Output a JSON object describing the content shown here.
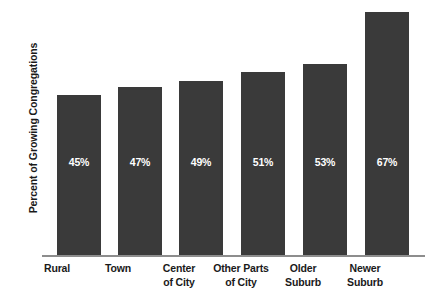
{
  "chart_data": {
    "type": "bar",
    "title": "",
    "xlabel": "",
    "ylabel": "Percent of Growing Congregations",
    "categories": [
      "Rural",
      "Town",
      "Center of City",
      "Other Parts of City",
      "Older Suburb",
      "Newer Suburb"
    ],
    "category_lines": [
      [
        "Rural",
        ""
      ],
      [
        "Town",
        ""
      ],
      [
        "Center",
        "of City"
      ],
      [
        "Other Parts",
        "of City"
      ],
      [
        "Older",
        "Suburb"
      ],
      [
        "Newer",
        "Suburb"
      ]
    ],
    "values": [
      45,
      47,
      49,
      51,
      53,
      67
    ],
    "value_labels": [
      "45%",
      "47%",
      "49%",
      "51%",
      "53%",
      "67%"
    ],
    "bar_pixel_heights": [
      161,
      169,
      175,
      184,
      192,
      244
    ],
    "grid": false,
    "legend": null,
    "bar_color": "#3a3a3a",
    "value_label_color": "#ffffff",
    "axis_color": "#8d8d8d",
    "background_color": "#ffffff"
  }
}
